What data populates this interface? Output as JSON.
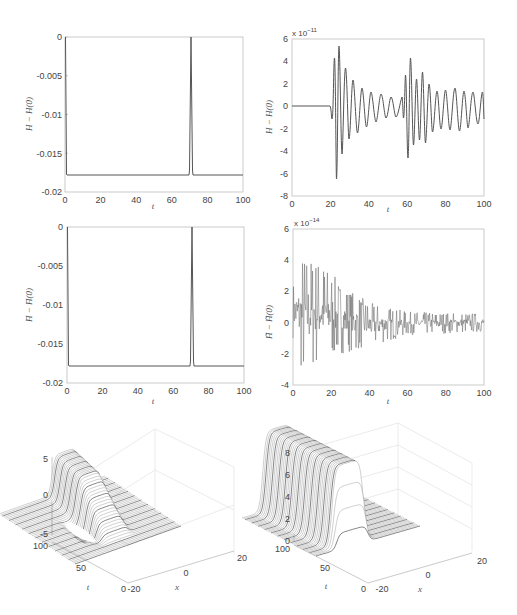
{
  "figure": {
    "panels": [
      {
        "id": "tl",
        "ylabel": "H − H(0)",
        "xlabel": "t"
      },
      {
        "id": "tr",
        "ylabel": "H − H(0)",
        "xlabel": "t",
        "exponent": "x 10",
        "exponent_power": "−11"
      },
      {
        "id": "ml",
        "ylabel": "H̄ − H̄(0)",
        "xlabel": "t"
      },
      {
        "id": "mr",
        "ylabel": "H̃ − H̃(0)",
        "xlabel": "t",
        "exponent": "x 10",
        "exponent_power": "−14"
      },
      {
        "id": "bl",
        "xlabel": "x",
        "tlabel": "t"
      },
      {
        "id": "br",
        "xlabel": "x",
        "tlabel": "t"
      }
    ]
  },
  "chart_data": [
    {
      "type": "line",
      "title": "",
      "xlabel": "t",
      "ylabel": "H − H(0)",
      "xlim": [
        0,
        100
      ],
      "ylim": [
        -0.02,
        0
      ],
      "xticks": [
        "0",
        "20",
        "40",
        "60",
        "80",
        "100"
      ],
      "yticks": [
        "0",
        "-0.005",
        "-0.01",
        "-0.015",
        "-0.02"
      ],
      "grid": false,
      "series": [
        {
          "name": "H - H(0)",
          "x": [
            0,
            0.5,
            1,
            70,
            71,
            72,
            73,
            74,
            100
          ],
          "y": [
            0,
            -0.017,
            -0.0178,
            -0.0178,
            -0.017,
            0,
            -0.017,
            -0.0178,
            -0.0178
          ]
        }
      ]
    },
    {
      "type": "line",
      "title": "",
      "xlabel": "t",
      "ylabel": "H − H(0)",
      "scale_note": "x 10^-11",
      "xlim": [
        0,
        100
      ],
      "ylim": [
        -8,
        6
      ],
      "xticks": [
        "0",
        "20",
        "40",
        "60",
        "80",
        "100"
      ],
      "yticks": [
        "6",
        "4",
        "2",
        "0",
        "-2",
        "-4",
        "-6",
        "-8"
      ],
      "grid": false,
      "series": [
        {
          "name": "H - H(0)",
          "x": [
            0,
            20,
            21,
            22,
            23,
            24.5,
            26,
            28,
            30,
            33,
            35,
            38,
            40,
            43,
            45,
            48,
            51,
            54,
            57,
            60,
            63,
            64,
            65,
            66,
            67,
            68.5,
            70,
            71.5,
            73,
            75,
            77,
            79,
            81,
            83,
            85,
            88,
            91,
            94,
            97,
            100
          ],
          "y": [
            0,
            0,
            -1.2,
            4.3,
            -6.5,
            5.3,
            -4.3,
            3.4,
            -2.9,
            2.3,
            -2.4,
            1.6,
            -2.1,
            1.2,
            -1.6,
            1.0,
            -1.3,
            0.7,
            -1.0,
            0.4,
            0.8,
            -2.6,
            2.7,
            -4.6,
            4.1,
            -3.6,
            2.4,
            -3.2,
            3.0,
            -3.4,
            2.0,
            -2.3,
            1.3,
            -2.0,
            1.4,
            -2.3,
            1.5,
            -2.4,
            1.3,
            -1.2
          ]
        }
      ]
    },
    {
      "type": "line",
      "title": "",
      "xlabel": "t",
      "ylabel": "H̄ − H̄(0)",
      "xlim": [
        0,
        100
      ],
      "ylim": [
        -0.02,
        0
      ],
      "xticks": [
        "0",
        "20",
        "40",
        "60",
        "80",
        "100"
      ],
      "yticks": [
        "0",
        "-0.005",
        "-0.01",
        "-0.015",
        "-0.02"
      ],
      "grid": false,
      "series": [
        {
          "name": "Hbar - Hbar(0)",
          "x": [
            0,
            0.5,
            1,
            70,
            71,
            72,
            73,
            74,
            100
          ],
          "y": [
            0,
            -0.017,
            -0.0178,
            -0.0178,
            -0.017,
            0,
            -0.017,
            -0.0178,
            -0.0178
          ]
        }
      ]
    },
    {
      "type": "line",
      "title": "",
      "xlabel": "t",
      "ylabel": "H̃ − H̃(0)",
      "scale_note": "x 10^-14",
      "xlim": [
        0,
        100
      ],
      "ylim": [
        -4,
        6
      ],
      "xticks": [
        "0",
        "20",
        "40",
        "60",
        "80",
        "100"
      ],
      "yticks": [
        "6",
        "4",
        "2",
        "0",
        "-2",
        "-4"
      ],
      "grid": false,
      "series": [
        {
          "name": "noise",
          "description": "high-frequency noisy signal with envelope decaying from about ±4 at t≈5 to about ±0.5 beyond t≈50",
          "envelope": {
            "x": [
              0,
              5,
              15,
              25,
              40,
              60,
              100
            ],
            "upper": [
              2.5,
              4.4,
              4.0,
              2.5,
              1.3,
              0.7,
              0.6
            ],
            "lower": [
              -1.0,
              -3.5,
              -2.5,
              -2.0,
              -1.6,
              -0.8,
              -0.6
            ]
          }
        }
      ]
    },
    {
      "type": "surface3d",
      "title": "",
      "xlabel": "x",
      "ylabel": "t",
      "xlim": [
        -20,
        20
      ],
      "ylim": [
        0,
        100
      ],
      "zlim": [
        -5,
        5
      ],
      "xticks": [
        "-20",
        "0",
        "20"
      ],
      "yticks": [
        "0",
        "50",
        "100"
      ],
      "zticks": [
        "5",
        "0",
        "-5"
      ],
      "description": "mesh surface: soliton-like hump rising to ~5, with a small dip near -2, flat plane at 0 elsewhere"
    },
    {
      "type": "surface3d",
      "title": "",
      "xlabel": "x",
      "ylabel": "t",
      "xlim": [
        -20,
        20
      ],
      "ylim": [
        0,
        100
      ],
      "zlim": [
        0,
        8
      ],
      "xticks": [
        "-20",
        "0",
        "20"
      ],
      "yticks": [
        "0",
        "50",
        "100"
      ],
      "zticks": [
        "8",
        "6",
        "4",
        "2",
        "0"
      ],
      "description": "mesh surface: plateau near 7-7.5 spanning a band of x, sharp edges, flat 0 elsewhere"
    }
  ]
}
